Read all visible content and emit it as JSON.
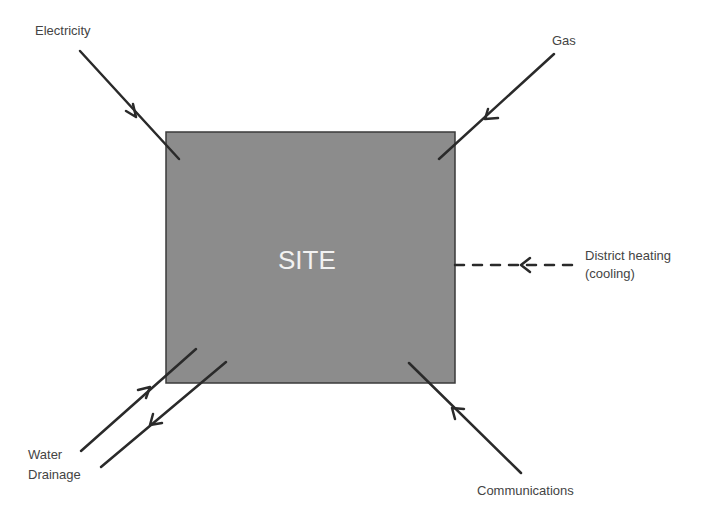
{
  "diagram": {
    "site_label": "SITE",
    "colors": {
      "site_fill": "#8c8c8c",
      "site_border": "#3a3a3a",
      "arrow": "#2a2a2a",
      "label_text": "#444444",
      "site_text": "#f2f2f2"
    },
    "flows": [
      {
        "id": "electricity",
        "label": "Electricity",
        "direction": "in",
        "style": "solid"
      },
      {
        "id": "gas",
        "label": "Gas",
        "direction": "in",
        "style": "solid"
      },
      {
        "id": "district_heating",
        "label_line1": "District heating",
        "label_line2": "(cooling)",
        "direction": "in",
        "style": "dashed"
      },
      {
        "id": "water",
        "label": "Water",
        "direction": "in",
        "style": "solid"
      },
      {
        "id": "drainage",
        "label": "Drainage",
        "direction": "out",
        "style": "solid"
      },
      {
        "id": "communications",
        "label": "Communications",
        "direction": "in",
        "style": "solid"
      }
    ]
  }
}
